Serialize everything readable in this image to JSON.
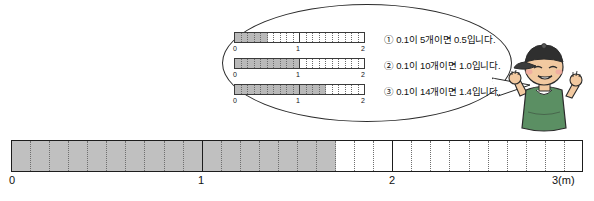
{
  "bubble": {
    "rows": [
      {
        "id": "row-1",
        "filled_cells": 5,
        "total_cells": 20,
        "ticks": [
          "0",
          "1",
          "2"
        ],
        "text": "① 0.1이 5개이면 0.5입니다."
      },
      {
        "id": "row-2",
        "filled_cells": 10,
        "total_cells": 20,
        "ticks": [
          "0",
          "1",
          "2"
        ],
        "text": "② 0.1이 10개이면 1.0입니다."
      },
      {
        "id": "row-3",
        "filled_cells": 14,
        "total_cells": 20,
        "ticks": [
          "0",
          "1",
          "2"
        ],
        "text": "③ 0.1이 14개이면 1.4입니다."
      }
    ]
  },
  "number_line": {
    "total_cells": 30,
    "filled_cells": 17,
    "major_ticks": [
      "0",
      "1",
      "2",
      "3(m)"
    ],
    "unit": "m",
    "value": 1.7
  },
  "colors": {
    "fill_gray": "#c0c0c0",
    "mini_fill_gray": "#b9b9b9",
    "outline": "#1d1d1d",
    "dotted": "#6f6f6f",
    "character_shirt": "#5b8f63",
    "character_cap": "#2f2f2f",
    "skin": "#f2c9a0"
  },
  "character": {
    "name": "boy-character",
    "pose": "waving"
  }
}
